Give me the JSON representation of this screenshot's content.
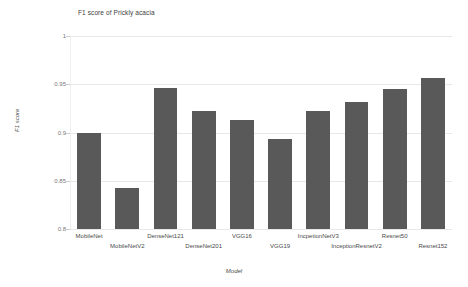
{
  "chart_data": {
    "type": "bar",
    "title": "F1 score of Prickly acacia",
    "xlabel": "Model",
    "ylabel": "F1 score",
    "ylim": [
      0.8,
      1.0
    ],
    "yticks": [
      "0.8",
      "0.85",
      "0.9",
      "0.95",
      "1"
    ],
    "ytick_values": [
      0.8,
      0.85,
      0.9,
      0.95,
      1.0
    ],
    "grid": true,
    "legend": "none",
    "bar_color": "#595959",
    "categories": [
      "MobileNet",
      "MobileNetV2",
      "DenseNet121",
      "DenseNet201",
      "VGG16",
      "VGG19",
      "IncpetionNetV3",
      "InceptionResnetV2",
      "Resnet50",
      "Resnet152"
    ],
    "values": [
      0.9,
      0.843,
      0.946,
      0.922,
      0.913,
      0.893,
      0.922,
      0.932,
      0.945,
      0.957
    ]
  }
}
